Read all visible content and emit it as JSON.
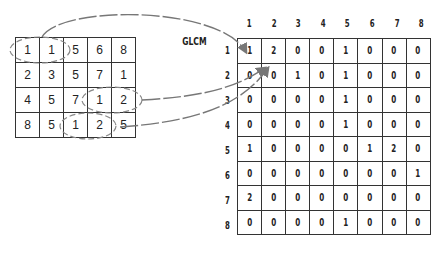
{
  "title": "GLCM",
  "image_matrix": [
    [
      1,
      1,
      5,
      6,
      8
    ],
    [
      2,
      3,
      5,
      7,
      1
    ],
    [
      4,
      5,
      7,
      1,
      2
    ],
    [
      8,
      5,
      1,
      2,
      5
    ]
  ],
  "glcm": {
    "col_labels": [
      "1",
      "2",
      "3",
      "4",
      "5",
      "6",
      "7",
      "8"
    ],
    "row_labels": [
      "1",
      "2",
      "3",
      "4",
      "5",
      "6",
      "7",
      "8"
    ],
    "rows": [
      [
        1,
        2,
        0,
        0,
        1,
        0,
        0,
        0
      ],
      [
        0,
        0,
        1,
        0,
        1,
        0,
        0,
        0
      ],
      [
        0,
        0,
        0,
        0,
        1,
        0,
        0,
        0
      ],
      [
        0,
        0,
        0,
        0,
        1,
        0,
        0,
        0
      ],
      [
        1,
        0,
        0,
        0,
        0,
        1,
        2,
        0
      ],
      [
        0,
        0,
        0,
        0,
        0,
        0,
        0,
        1
      ],
      [
        2,
        0,
        0,
        0,
        0,
        0,
        0,
        0
      ],
      [
        0,
        0,
        0,
        0,
        1,
        0,
        0,
        0
      ]
    ]
  },
  "highlighted_pairs": [
    {
      "pair": "1,1",
      "target_cell": "1,1"
    },
    {
      "pair": "1,2",
      "target_cell": "1,2"
    },
    {
      "pair": "1,2",
      "target_cell": "1,2"
    }
  ],
  "colors": {
    "line": "#333333",
    "arrow": "#777777"
  }
}
